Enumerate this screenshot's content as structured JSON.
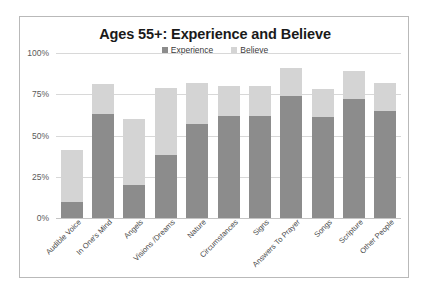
{
  "chart_data": {
    "type": "bar",
    "subtype": "stacked-bar",
    "title": "Ages 55+: Experience and Believe",
    "xlabel": "",
    "ylabel": "",
    "ylim": [
      0,
      100
    ],
    "y_ticks": [
      "0%",
      "25%",
      "50%",
      "75%",
      "100%"
    ],
    "y_tick_values": [
      0,
      25,
      50,
      75,
      100
    ],
    "grid": true,
    "legend_position": "top-center",
    "categories": [
      "Audible Voice",
      "In One's Mind",
      "Angels",
      "Visions /Dreams",
      "Nature",
      "Circumstances",
      "Signs",
      "Answers To Prayer",
      "Songs",
      "Scripture",
      "Other People"
    ],
    "series": [
      {
        "name": "Experience",
        "color": "#8c8c8c",
        "values": [
          10,
          63,
          20,
          38,
          57,
          62,
          62,
          74,
          61,
          72,
          65
        ]
      },
      {
        "name": "Believe",
        "color": "#d4d4d4",
        "values": [
          31,
          18,
          40,
          41,
          25,
          18,
          18,
          17,
          17,
          17,
          17
        ]
      }
    ],
    "stack_totals": [
      41,
      81,
      60,
      79,
      82,
      80,
      80,
      91,
      78,
      89,
      82
    ]
  },
  "legend": {
    "items": [
      {
        "label": "Experience",
        "color": "#8c8c8c"
      },
      {
        "label": "Believe",
        "color": "#d4d4d4"
      }
    ]
  },
  "colors": {
    "experience": "#8c8c8c",
    "believe": "#d4d4d4",
    "gridline": "#d8d8d8",
    "frame": "#b9b9b9",
    "title_text": "#1a1a1a",
    "axis_text": "#5a5a5a",
    "background": "#ffffff"
  }
}
